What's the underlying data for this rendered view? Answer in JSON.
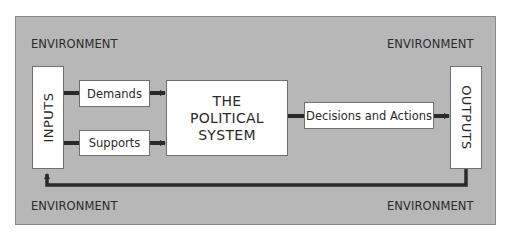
{
  "diagram": {
    "environment_labels": {
      "top_left": "ENVIRONMENT",
      "top_right": "ENVIRONMENT",
      "bottom_left": "ENVIRONMENT",
      "bottom_right": "ENVIRONMENT"
    },
    "inputs": {
      "label": "INPUTS"
    },
    "demands": {
      "label": "Demands"
    },
    "supports": {
      "label": "Supports"
    },
    "system": {
      "line1": "THE",
      "line2": "POLITICAL",
      "line3": "SYSTEM"
    },
    "decisions": {
      "label": "Decisions and Actions"
    },
    "outputs": {
      "label": "OUTPUTS"
    },
    "colors": {
      "environment_fill": "#b7b7b7",
      "box_fill": "#ffffff",
      "arrow": "#2a2a2a"
    },
    "flows": [
      {
        "from": "inputs",
        "to": "demands"
      },
      {
        "from": "inputs",
        "to": "supports"
      },
      {
        "from": "demands",
        "to": "system"
      },
      {
        "from": "supports",
        "to": "system"
      },
      {
        "from": "system",
        "to": "decisions"
      },
      {
        "from": "decisions",
        "to": "outputs"
      },
      {
        "from": "outputs",
        "to": "inputs",
        "type": "feedback"
      }
    ]
  }
}
